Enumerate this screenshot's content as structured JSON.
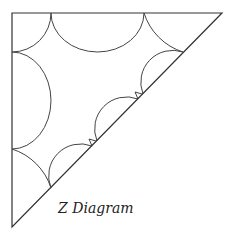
{
  "diagram": {
    "title": "Z Diagram",
    "stroke_color": "#333333",
    "background": "#ffffff",
    "triangle": {
      "vertices": [
        [
          12,
          13
        ],
        [
          222,
          13
        ],
        [
          12,
          227
        ]
      ]
    },
    "arcs": [
      {
        "name": "top-left-corner-arc",
        "from": [
          51,
          13
        ],
        "to": [
          12,
          52
        ],
        "r": 39
      },
      {
        "name": "top-semicircle",
        "from": [
          51,
          13
        ],
        "to": [
          144,
          13
        ],
        "r": 46.5
      },
      {
        "name": "top-right-corner-arc",
        "from": [
          144,
          13
        ],
        "to": [
          183,
          52
        ],
        "r": 78
      },
      {
        "name": "left-semicircle",
        "from": [
          12,
          52
        ],
        "to": [
          12,
          149
        ],
        "r": 48.5
      },
      {
        "name": "bottom-corner-arc",
        "from": [
          12,
          149
        ],
        "to": [
          51,
          188
        ],
        "r": 78
      },
      {
        "name": "diagonal-arc-1",
        "from": [
          51,
          188
        ],
        "to": [
          92,
          146
        ],
        "r": 34
      },
      {
        "name": "diagonal-arc-2",
        "from": [
          97,
          141
        ],
        "to": [
          138,
          99
        ],
        "r": 34
      },
      {
        "name": "diagonal-arc-3",
        "from": [
          143,
          94
        ],
        "to": [
          183,
          52
        ],
        "r": 34
      }
    ],
    "markers": [
      {
        "name": "kink-marker-1",
        "points": [
          [
            89,
            139
          ],
          [
            96,
            141
          ],
          [
            92,
            146
          ]
        ]
      },
      {
        "name": "kink-marker-2",
        "points": [
          [
            135,
            92
          ],
          [
            142,
            94
          ],
          [
            138,
            99
          ]
        ]
      }
    ]
  }
}
